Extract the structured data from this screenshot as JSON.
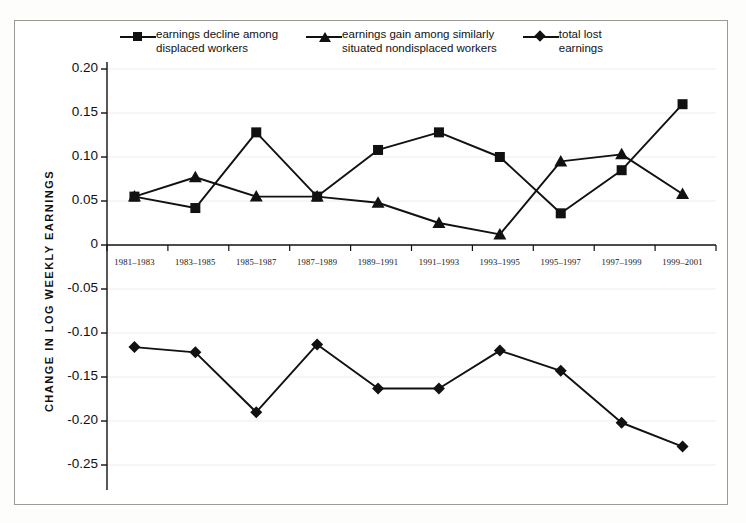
{
  "figure": {
    "background_color": "#ffffff",
    "border_color": "#9a9a96",
    "ink_color": "#111111",
    "gridline_color": "#ededed"
  },
  "axis": {
    "y_title": "CHANGE IN LOG WEEKLY EARNINGS",
    "y_ticks": [
      "0.20",
      "0.15",
      "0.10",
      "0.05",
      "0",
      "-0.05",
      "-0.10",
      "-0.15",
      "-0.20",
      "-0.25"
    ],
    "y_tick_values": [
      0.2,
      0.15,
      0.1,
      0.05,
      0,
      -0.05,
      -0.1,
      -0.15,
      -0.2,
      -0.25
    ],
    "x_title": "",
    "x_ticks": [
      "1981–1983",
      "1983–1985",
      "1985–1987",
      "1987–1989",
      "1989–1991",
      "1991–1993",
      "1993–1995",
      "1995–1997",
      "1997–1999",
      "1999–2001"
    ]
  },
  "legend": {
    "position": "top",
    "entries": [
      {
        "marker": "square-marker",
        "label": "earnings decline among\ndisplaced workers"
      },
      {
        "marker": "triangle-marker",
        "label": "earnings gain among similarly\nsituated nondisplaced workers"
      },
      {
        "marker": "diamond-marker",
        "label": "total lost\nearnings"
      }
    ]
  },
  "chart_data": {
    "type": "line",
    "title": "",
    "xlabel": "",
    "ylabel": "CHANGE IN LOG WEEKLY EARNINGS",
    "categories": [
      "1981–1983",
      "1983–1985",
      "1985–1987",
      "1987–1989",
      "1989–1991",
      "1991–1993",
      "1993–1995",
      "1995–1997",
      "1997–1999",
      "1999–2001"
    ],
    "ylim": [
      -0.25,
      0.2
    ],
    "yticks": [
      -0.25,
      -0.2,
      -0.15,
      -0.1,
      -0.05,
      0,
      0.05,
      0.1,
      0.15,
      0.2
    ],
    "grid": true,
    "legend_position": "top",
    "series": [
      {
        "name": "earnings decline among displaced workers",
        "marker": "square",
        "values": [
          0.055,
          0.042,
          0.128,
          0.055,
          0.108,
          0.128,
          0.1,
          0.036,
          0.085,
          0.16
        ]
      },
      {
        "name": "earnings gain among similarly situated nondisplaced workers",
        "marker": "triangle",
        "values": [
          0.055,
          0.077,
          0.055,
          0.055,
          0.048,
          0.025,
          0.012,
          0.095,
          0.103,
          0.058
        ]
      },
      {
        "name": "total lost earnings",
        "marker": "diamond",
        "values": [
          -0.116,
          -0.122,
          -0.19,
          -0.113,
          -0.163,
          -0.163,
          -0.12,
          -0.143,
          -0.202,
          -0.229
        ]
      }
    ]
  }
}
